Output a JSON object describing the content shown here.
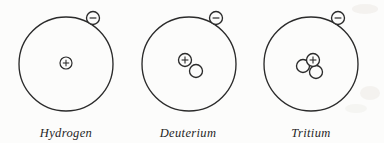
{
  "figure": {
    "background_color": "#fcfcfb",
    "stroke_color": "#2b2b2b",
    "atoms": [
      {
        "name": "hydrogen",
        "label": "Hydrogen",
        "orbit": {
          "cx": 66,
          "cy": 64,
          "r": 47
        },
        "electron": {
          "cx": 93,
          "cy": 18,
          "r": 6.5,
          "charge": "−",
          "icon": "electron-icon"
        },
        "nucleus": {
          "protons": 1,
          "neutrons": 0,
          "particles": [
            {
              "kind": "proton",
              "cx": 66,
              "cy": 63,
              "r": 6.0,
              "charge": "+",
              "icon": "proton-icon"
            }
          ]
        }
      },
      {
        "name": "deuterium",
        "label": "Deuterium",
        "orbit": {
          "cx": 189,
          "cy": 64,
          "r": 47
        },
        "electron": {
          "cx": 216,
          "cy": 18,
          "r": 6.5,
          "charge": "−",
          "icon": "electron-icon"
        },
        "nucleus": {
          "protons": 1,
          "neutrons": 1,
          "particles": [
            {
              "kind": "proton",
              "cx": 185,
              "cy": 60,
              "r": 6.5,
              "charge": "+",
              "icon": "proton-icon"
            },
            {
              "kind": "neutron",
              "cx": 196,
              "cy": 71,
              "r": 6.5,
              "charge": "",
              "icon": "neutron-icon"
            }
          ]
        }
      },
      {
        "name": "tritium",
        "label": "Tritium",
        "orbit": {
          "cx": 311,
          "cy": 64,
          "r": 47
        },
        "electron": {
          "cx": 338,
          "cy": 18,
          "r": 6.5,
          "charge": "−",
          "icon": "electron-icon"
        },
        "nucleus": {
          "protons": 1,
          "neutrons": 2,
          "particles": [
            {
              "kind": "neutron",
              "cx": 303,
              "cy": 66,
              "r": 6.5,
              "charge": "",
              "icon": "neutron-icon"
            },
            {
              "kind": "proton",
              "cx": 313,
              "cy": 60,
              "r": 6.5,
              "charge": "+",
              "icon": "proton-icon"
            },
            {
              "kind": "neutron",
              "cx": 316,
              "cy": 72,
              "r": 6.5,
              "charge": "",
              "icon": "neutron-icon"
            }
          ]
        }
      }
    ]
  }
}
